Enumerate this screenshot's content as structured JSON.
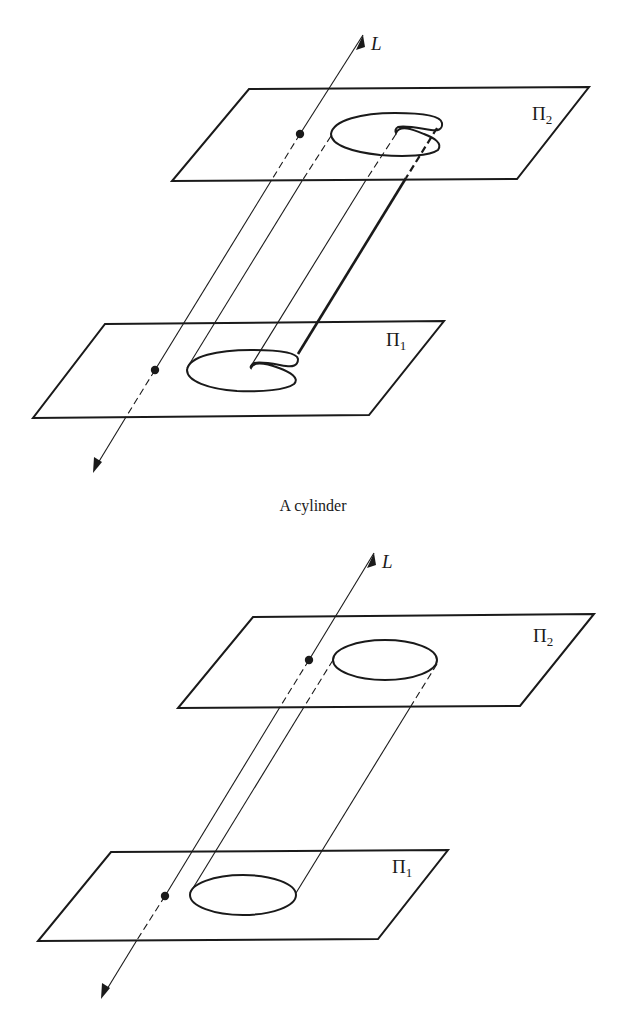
{
  "figure_top": {
    "axis_label": "L",
    "upper_plane": {
      "symbol": "Π",
      "subscript": "2"
    },
    "lower_plane": {
      "symbol": "Π",
      "subscript": "1"
    },
    "directrix_shape": "notched closed curve (kidney/C-shaped)",
    "caption": "A cylinder"
  },
  "figure_bottom": {
    "axis_label": "L",
    "upper_plane": {
      "symbol": "Π",
      "subscript": "2"
    },
    "lower_plane": {
      "symbol": "Π",
      "subscript": "1"
    },
    "directrix_shape": "ellipse"
  },
  "colors": {
    "ink": "#1a1a1a",
    "background": "#ffffff"
  }
}
